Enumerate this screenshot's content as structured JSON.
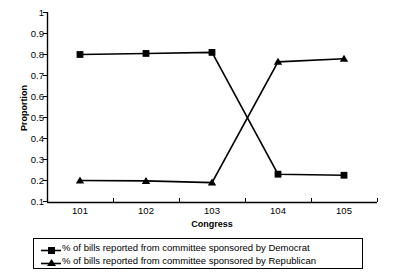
{
  "chart_data": {
    "type": "line",
    "title": "",
    "xlabel": "Congress",
    "ylabel": "Proportion",
    "categories": [
      "101",
      "102",
      "103",
      "104",
      "105"
    ],
    "ylim": [
      0.1,
      1
    ],
    "yticks": [
      "1",
      "0.9",
      "0.8",
      "0.7",
      "0.6",
      "0.5",
      "0.4",
      "0.3",
      "0.2",
      "0.1"
    ],
    "ytick_values": [
      1,
      0.9,
      0.8,
      0.7,
      0.6,
      0.5,
      0.4,
      0.3,
      0.2,
      0.1
    ],
    "grid": false,
    "legend_position": "bottom",
    "series": [
      {
        "name": "% of bills reported from committee sponsored by Democrat",
        "marker": "square",
        "color": "#000000",
        "values": [
          0.8,
          0.805,
          0.81,
          0.23,
          0.225
        ]
      },
      {
        "name": "% of bills reported from committee sponsored by Republican",
        "marker": "triangle",
        "color": "#000000",
        "values": [
          0.2,
          0.198,
          0.19,
          0.765,
          0.78
        ]
      }
    ]
  },
  "legend": {
    "items": [
      {
        "label": "% of bills reported from committee sponsored by Democrat",
        "marker": "square-marker-icon"
      },
      {
        "label": "% of bills reported from committee sponsored by Republican",
        "marker": "triangle-marker-icon"
      }
    ]
  },
  "axes": {
    "y_title": "Proportion",
    "x_title": "Congress"
  }
}
